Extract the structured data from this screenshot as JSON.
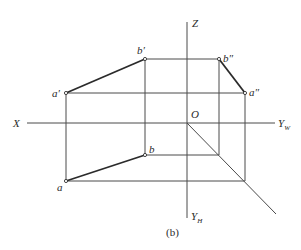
{
  "diagram": {
    "caption": "(b)",
    "axes": {
      "x_label": "X",
      "z_label": "Z",
      "origin_label": "O",
      "yw_label": "Y",
      "yw_sub": "W",
      "yh_label": "Y",
      "yh_sub": "H"
    },
    "points": {
      "a_prime": "a′",
      "b_prime": "b′",
      "a_double": "a″",
      "b_double": "b″",
      "a": "a",
      "b": "b"
    },
    "coordinates": {
      "origin": [
        187,
        123
      ],
      "a_prime": [
        66,
        93
      ],
      "b_prime": [
        145,
        59
      ],
      "b_double": [
        219,
        59
      ],
      "a_double": [
        245,
        93
      ],
      "b": [
        145,
        155
      ],
      "a": [
        66,
        181
      ]
    },
    "colors": {
      "line": "#4a4a4a",
      "segment": "#2b2b2b",
      "text": "#2a2a2a",
      "background": "#ffffff"
    }
  }
}
